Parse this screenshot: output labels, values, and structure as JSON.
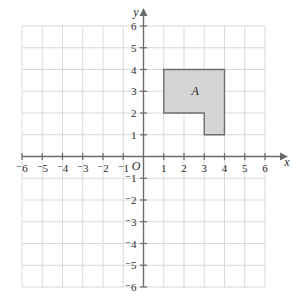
{
  "figure": {
    "type": "coordinate-plane",
    "origin_label": "O",
    "x_axis_name": "x",
    "y_axis_name": "y",
    "grid": true,
    "grid_color": "#d9d9d9",
    "axis_color": "#6b6b6b",
    "x_range": [
      -6,
      6
    ],
    "y_range": [
      -6,
      6
    ],
    "x_tick_labels": [
      "⁻6",
      "⁻5",
      "⁻4",
      "⁻3",
      "⁻2",
      "⁻1",
      "1",
      "2",
      "3",
      "4",
      "5",
      "6"
    ],
    "x_tick_values": [
      -6,
      -5,
      -4,
      -3,
      -2,
      -1,
      1,
      2,
      3,
      4,
      5,
      6
    ],
    "y_tick_labels": [
      "6",
      "5",
      "4",
      "3",
      "2",
      "1",
      "⁻1",
      "⁻2",
      "⁻3",
      "⁻4",
      "⁻5",
      "⁻6"
    ],
    "y_tick_values": [
      6,
      5,
      4,
      3,
      2,
      1,
      -1,
      -2,
      -3,
      -4,
      -5,
      -6
    ]
  },
  "shapes": [
    {
      "label": "A",
      "label_position": [
        2.55,
        3.0
      ],
      "fill_color": "#d5d5d5",
      "stroke_color": "#6e6e6e",
      "vertices": [
        [
          1,
          4
        ],
        [
          4,
          4
        ],
        [
          4,
          1
        ],
        [
          3,
          1
        ],
        [
          3,
          2
        ],
        [
          1,
          2
        ]
      ]
    }
  ]
}
